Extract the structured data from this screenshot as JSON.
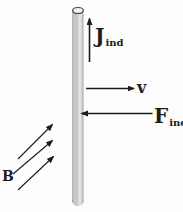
{
  "diagram": {
    "colors": {
      "background": "#fdfdfd",
      "line": "#1c1c1c",
      "rod_edge": "#6f6f6f",
      "rod_fill": "#c7c7c7",
      "rod_highlight": "#ebebeb",
      "rod_shade": "#a3a3a3",
      "cap_fill": "#f4f4f2",
      "cap_stroke": "#3f3f3f"
    },
    "labels": {
      "current": {
        "main": "J",
        "sub": "ind"
      },
      "velocity": {
        "main": "v",
        "sub": ""
      },
      "force": {
        "main": "F",
        "sub": "ind"
      },
      "field": {
        "main": "B",
        "sub": ""
      }
    },
    "arrows": {
      "current_direction": "up",
      "velocity_direction": "right",
      "force_direction": "left",
      "field_direction": "up-right",
      "field_arrow_count": 3
    }
  }
}
